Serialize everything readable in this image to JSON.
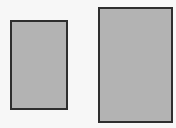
{
  "diagram": {
    "shapes": [
      {
        "type": "rectangle",
        "label": "",
        "fill": "#b3b3b3",
        "stroke": "#2e2e2e"
      },
      {
        "type": "rectangle",
        "label": "",
        "fill": "#b3b3b3",
        "stroke": "#2e2e2e"
      }
    ]
  }
}
